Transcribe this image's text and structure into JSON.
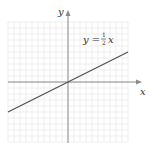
{
  "chart_data": {
    "type": "line",
    "title": "",
    "xlabel": "x",
    "ylabel": "y",
    "xlim": [
      -10,
      10
    ],
    "ylim": [
      -10,
      10
    ],
    "grid": true,
    "tick_labels": false,
    "annotation": "y = 1/2 x",
    "series": [
      {
        "name": "y = 1/2 x",
        "x": [
          -10,
          0,
          10
        ],
        "y": [
          -5,
          0,
          5
        ]
      }
    ]
  },
  "labels": {
    "x_axis": "x",
    "y_axis": "y",
    "equation_lhs": "y =",
    "equation_num": "1",
    "equation_den": "2",
    "equation_rhs": "x"
  },
  "colors": {
    "grid": "#e4e4e4",
    "axis": "#8a8a8a",
    "line": "#555555",
    "text": "#333333"
  }
}
